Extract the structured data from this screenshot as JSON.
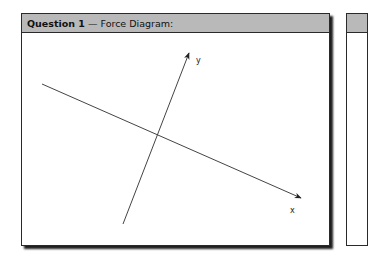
{
  "panel": {
    "title_bold": "Question 1",
    "title_dash": " — ",
    "title_rest": "Force Diagram:"
  },
  "diagram": {
    "axes": [
      {
        "label": "y",
        "from": [
          122,
          224
        ],
        "to": [
          188,
          53
        ],
        "arrow": "end"
      },
      {
        "label": "x",
        "from": [
          41,
          84
        ],
        "to": [
          300,
          198
        ],
        "arrow": "end"
      }
    ],
    "colors": {
      "header_bg": "#b9b9b9",
      "line": "#444444",
      "border": "#2a2a2a"
    }
  }
}
